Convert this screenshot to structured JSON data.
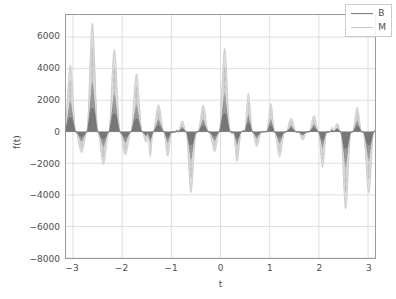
{
  "chart_data": {
    "type": "line",
    "title": "",
    "xlabel": "t",
    "ylabel": "f(t)",
    "xlim": [
      -3.14159,
      3.14159
    ],
    "ylim": [
      -8000,
      7400
    ],
    "grid": true,
    "legend_position": "upper right",
    "xticks": [
      -3,
      -2,
      -1,
      0,
      1,
      2,
      3
    ],
    "xtick_labels": [
      "−3",
      "−2",
      "−1",
      "0",
      "1",
      "2",
      "3"
    ],
    "yticks": [
      6000,
      4000,
      2000,
      0,
      -2000,
      -4000,
      -6000,
      -8000
    ],
    "ytick_labels": [
      "6000",
      "4000",
      "2000",
      "0",
      "−2000",
      "−4000",
      "−6000",
      "−8000"
    ],
    "series": [
      {
        "name": "B",
        "color": "#7f7f7f",
        "linewidth": 1.3,
        "description": "inner dark envelope family of partial sums"
      },
      {
        "name": "M",
        "color": "#bfbfbf",
        "linewidth": 0.8,
        "description": "outer light envelope family of partial sums"
      }
    ],
    "envelopes": [
      {
        "id": "outer",
        "fill": "#d9d9d9",
        "amplitude": 1.0,
        "note": "largest nested curve, peaks near 6900 and troughs near -7300"
      },
      {
        "id": "mid",
        "fill": "#bdbdbd",
        "amplitude": 0.78,
        "note": "mid band"
      },
      {
        "id": "inner",
        "fill": "#9e9e9e",
        "amplitude": 0.45,
        "note": "inner band"
      },
      {
        "id": "core",
        "fill": "#777777",
        "amplitude": 0.22,
        "note": "darkest core band around zero"
      }
    ],
    "lobe_peaks_t": [
      -3.0,
      -2.5,
      -2.0,
      -1.7,
      -1.2,
      -0.95,
      -0.65,
      -0.4,
      0.12,
      0.4,
      0.65,
      0.9,
      1.15,
      1.45,
      1.7,
      1.95,
      2.25,
      2.5,
      2.75,
      3.05
    ],
    "lobe_peaks_value": [
      4200,
      6900,
      5150,
      3600,
      -6050,
      1850,
      -5750,
      2100,
      5600,
      -4200,
      6500,
      -2050,
      6900,
      -4050,
      3450,
      -5650,
      2100,
      -7300,
      2650,
      -4550
    ],
    "n_major_lobes": 14,
    "base_frequency_cycles_over_range": 14
  },
  "axes": {
    "xlabel": "t",
    "ylabel": "f(t)"
  },
  "legend": {
    "entries": [
      {
        "label": "B",
        "color": "#7f7f7f"
      },
      {
        "label": "M",
        "color": "#c4c4c4"
      }
    ]
  }
}
